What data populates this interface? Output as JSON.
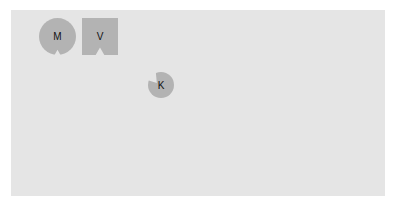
{
  "diagram": {
    "background_color": "#e5e5e5",
    "shape_color": "#b3b3b3",
    "shapes": [
      {
        "id": "m",
        "kind": "notched-circle",
        "label": "M",
        "notch": "bottom"
      },
      {
        "id": "v",
        "kind": "notched-square",
        "label": "V",
        "notch": "bottom"
      },
      {
        "id": "k",
        "kind": "notched-circle",
        "label": "K",
        "notch": "upper-left"
      }
    ]
  }
}
